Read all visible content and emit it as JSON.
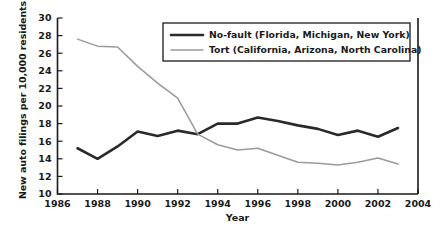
{
  "chart_data": {
    "type": "line",
    "title": "",
    "xlabel": "Year",
    "ylabel": "New auto filings per 10,000 residents",
    "xlim": [
      1986,
      2004
    ],
    "ylim": [
      10,
      30
    ],
    "xticks": [
      1986,
      1988,
      1990,
      1992,
      1994,
      1996,
      1998,
      2000,
      2002,
      2004
    ],
    "yticks": [
      10,
      12,
      14,
      16,
      18,
      20,
      22,
      24,
      26,
      28,
      30
    ],
    "grid": false,
    "legend_position": "top-right",
    "x": [
      1987,
      1988,
      1989,
      1990,
      1991,
      1992,
      1993,
      1994,
      1995,
      1996,
      1997,
      1998,
      1999,
      2000,
      2001,
      2002,
      2003
    ],
    "series": [
      {
        "name": "No-fault (Florida, Michigan, New York)",
        "color": "#2a2a2a",
        "width": 2.6,
        "values": [
          15.2,
          14.0,
          15.4,
          17.1,
          16.6,
          17.2,
          16.8,
          18.0,
          18.0,
          18.7,
          18.3,
          17.8,
          17.4,
          16.7,
          17.2,
          16.5,
          17.5
        ]
      },
      {
        "name": "Tort (California, Arizona, North Carolina)",
        "color": "#9a9a9a",
        "width": 1.5,
        "values": [
          27.6,
          26.8,
          26.7,
          24.5,
          22.6,
          20.9,
          16.8,
          15.6,
          15.0,
          15.2,
          14.4,
          13.6,
          13.5,
          13.3,
          13.6,
          14.1,
          13.4
        ]
      }
    ]
  },
  "legend": {
    "entries": [
      {
        "label": "No-fault (Florida, Michigan, New York)"
      },
      {
        "label": "Tort (California, Arizona, North Carolina)"
      }
    ]
  },
  "axis": {
    "y_title": "New auto filings per 10,000 residents",
    "x_title": "Year"
  }
}
